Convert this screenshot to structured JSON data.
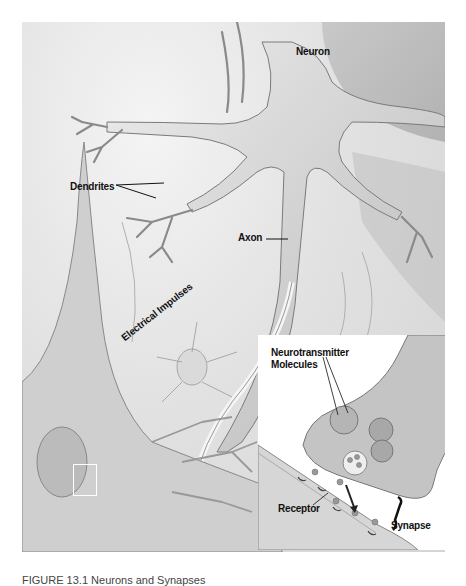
{
  "figure": {
    "labels": {
      "neuron": "Neuron",
      "dendrites": "Dendrites",
      "axon": "Axon",
      "electrical_impulses": "Electrical Impulses"
    },
    "inset": {
      "neurotransmitter_line1": "Neurotransmitter",
      "neurotransmitter_line2": "Molecules",
      "receptor": "Receptor",
      "synapse": "Synapse"
    },
    "caption": "FIGURE 13.1  Neurons and Synapses"
  },
  "colors": {
    "background": "#ffffff",
    "tissue": "#d8d8d8",
    "cell_body": "#c8c8c8",
    "label_text": "#111111"
  }
}
